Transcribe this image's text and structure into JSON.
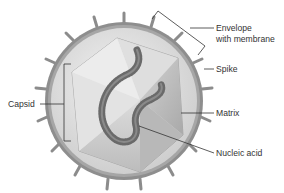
{
  "diagram": {
    "labels": {
      "envelope_line1": "Envelope",
      "envelope_line2": "with membrane",
      "spike": "Spike",
      "capsid": "Capsid",
      "matrix": "Matrix",
      "nucleic_acid": "Nucleic acid"
    },
    "colors": {
      "envelope_outer": "#8a8a8a",
      "envelope_inner": "#b8b8b8",
      "matrix": "#d6d6d6",
      "capsid_light": "#e6e6e6",
      "capsid_dark": "#b0b0b0",
      "nucleic_acid": "#6e6e6e",
      "leader_line": "#333333",
      "text": "#333333"
    },
    "spike_count": 18
  }
}
